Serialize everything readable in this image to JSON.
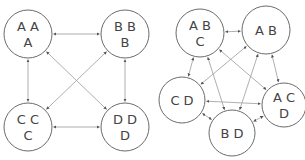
{
  "colors": {
    "node_stroke": "#6b6b6b",
    "edge_stroke": "#9a9a9a",
    "text": "#444444",
    "background": "#ffffff"
  },
  "diagrams": [
    {
      "name": "left-graph",
      "nodes": [
        {
          "id": "n-aaa",
          "cx": 28,
          "cy": 34,
          "r": 24,
          "lines": [
            "A A",
            "A"
          ]
        },
        {
          "id": "n-bbb",
          "cx": 125,
          "cy": 34,
          "r": 24,
          "lines": [
            "B B",
            "B"
          ]
        },
        {
          "id": "n-ccc",
          "cx": 28,
          "cy": 127,
          "r": 24,
          "lines": [
            "C C",
            "C"
          ]
        },
        {
          "id": "n-ddd",
          "cx": 125,
          "cy": 127,
          "r": 24,
          "lines": [
            "D D",
            "D"
          ]
        }
      ],
      "edges": [
        {
          "from": "n-aaa",
          "to": "n-bbb"
        },
        {
          "from": "n-aaa",
          "to": "n-ccc"
        },
        {
          "from": "n-aaa",
          "to": "n-ddd"
        },
        {
          "from": "n-bbb",
          "to": "n-ccc"
        },
        {
          "from": "n-bbb",
          "to": "n-ddd"
        },
        {
          "from": "n-ccc",
          "to": "n-ddd"
        }
      ]
    },
    {
      "name": "right-graph",
      "nodes": [
        {
          "id": "n-abc",
          "cx": 200,
          "cy": 33,
          "r": 24,
          "lines": [
            "A B",
            "C"
          ]
        },
        {
          "id": "n-ab",
          "cx": 266,
          "cy": 30,
          "r": 24,
          "lines": [
            "A B"
          ]
        },
        {
          "id": "n-cd",
          "cx": 182,
          "cy": 100,
          "r": 23,
          "lines": [
            "C D"
          ]
        },
        {
          "id": "n-acd",
          "cx": 284,
          "cy": 105,
          "r": 22,
          "lines": [
            "A C",
            "D"
          ]
        },
        {
          "id": "n-bd",
          "cx": 232,
          "cy": 133,
          "r": 23,
          "lines": [
            "B D"
          ]
        }
      ],
      "edges": [
        {
          "from": "n-abc",
          "to": "n-ab"
        },
        {
          "from": "n-abc",
          "to": "n-cd"
        },
        {
          "from": "n-abc",
          "to": "n-acd"
        },
        {
          "from": "n-abc",
          "to": "n-bd"
        },
        {
          "from": "n-ab",
          "to": "n-cd"
        },
        {
          "from": "n-ab",
          "to": "n-acd"
        },
        {
          "from": "n-ab",
          "to": "n-bd"
        },
        {
          "from": "n-cd",
          "to": "n-acd"
        },
        {
          "from": "n-cd",
          "to": "n-bd"
        },
        {
          "from": "n-acd",
          "to": "n-bd"
        }
      ]
    }
  ]
}
